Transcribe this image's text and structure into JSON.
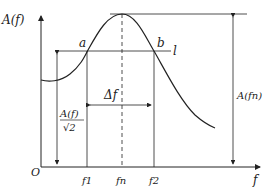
{
  "diagram": {
    "type": "resonance-curve",
    "y_axis_label": "A(f)",
    "x_axis_label": "f",
    "origin_label": "O",
    "points": {
      "a": "a",
      "b": "b"
    },
    "line_label": "l",
    "bandwidth_label": "Δf",
    "half_power_label_num": "A(f)",
    "half_power_label_den": "√2",
    "peak_amplitude_label": "A(fn)",
    "x_ticks": [
      "f1",
      "fn",
      "f2"
    ],
    "colors": {
      "line": "#222222",
      "background": "#ffffff"
    }
  }
}
